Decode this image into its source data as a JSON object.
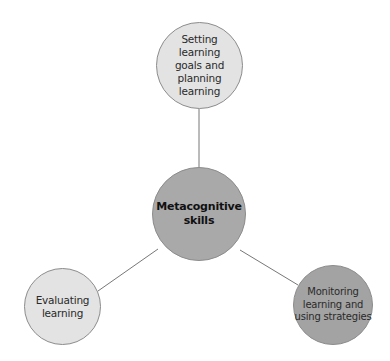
{
  "diagram": {
    "type": "hub-and-spoke",
    "center": {
      "label": "Metacognitive skills",
      "lines": [
        "Metacognitive",
        "skills"
      ],
      "fill": "#a9a9a9"
    },
    "nodes": [
      {
        "id": "top",
        "label": "Setting learning goals and planning learning",
        "lines": [
          "Setting",
          "learning",
          "goals and",
          "planning",
          "learning"
        ],
        "fill": "#e3e3e3"
      },
      {
        "id": "left",
        "label": "Evaluating learning",
        "lines": [
          "Evaluating",
          "learning"
        ],
        "fill": "#e3e3e3"
      },
      {
        "id": "right",
        "label": "Monitoring learning and using strategies",
        "lines": [
          "Monitoring",
          "learning and",
          "using strategies"
        ],
        "fill": "#a3a3a3"
      }
    ],
    "edges": [
      {
        "from": "center",
        "to": "top"
      },
      {
        "from": "center",
        "to": "left"
      },
      {
        "from": "center",
        "to": "right"
      }
    ],
    "line_color": "#777777",
    "border_color": "#8c8c8c"
  }
}
